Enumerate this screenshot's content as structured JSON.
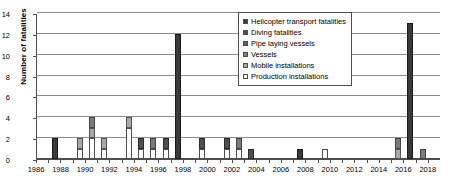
{
  "chart_data": {
    "type": "bar",
    "title": "",
    "xlabel": "",
    "ylabel": "Number of fatalities",
    "ylim": [
      0,
      14
    ],
    "ytick_step": 2,
    "yticks": [
      "0",
      "2",
      "4",
      "6",
      "8",
      "10",
      "12",
      "14"
    ],
    "xlim": [
      1986,
      2018
    ],
    "xticks": [
      "1986",
      "1988",
      "1990",
      "1992",
      "1994",
      "1996",
      "1998",
      "2000",
      "2002",
      "2004",
      "2006",
      "2008",
      "2010",
      "2012",
      "2014",
      "2016",
      "2018"
    ],
    "grid": "horizontal",
    "stacked": true,
    "legend_position": "top-right",
    "categories": [
      1986,
      1987,
      1988,
      1989,
      1990,
      1991,
      1992,
      1993,
      1994,
      1995,
      1996,
      1997,
      1998,
      1999,
      2000,
      2001,
      2002,
      2003,
      2004,
      2005,
      2006,
      2007,
      2008,
      2009,
      2010,
      2011,
      2012,
      2013,
      2014,
      2015,
      2016,
      2017,
      2018
    ],
    "series": [
      {
        "name": "Helicopter transport fatalities",
        "color": "#3a3a3a",
        "values": [
          0,
          2,
          0,
          0,
          0,
          0,
          0,
          0,
          0,
          0,
          0,
          12,
          0,
          0,
          0,
          0,
          0,
          0,
          0,
          0,
          0,
          1,
          0,
          0,
          0,
          0,
          0,
          0,
          0,
          0,
          13,
          0,
          0
        ]
      },
      {
        "name": "Diving fatalities",
        "color": "#4f4f4f",
        "values": [
          0,
          0,
          0,
          0,
          0,
          0,
          0,
          0,
          1,
          0,
          1,
          0,
          0,
          1,
          0,
          1,
          0,
          1,
          0,
          0,
          0,
          0,
          0,
          0,
          0,
          0,
          0,
          0,
          0,
          0,
          0,
          0,
          0
        ]
      },
      {
        "name": "Pipe laying vessels",
        "color": "#5f5f5f",
        "values": [
          0,
          0,
          0,
          0,
          0,
          0,
          0,
          0,
          0,
          0,
          0,
          0,
          0,
          0,
          0,
          0,
          0,
          0,
          0,
          0,
          0,
          0,
          0,
          0,
          0,
          0,
          0,
          0,
          0,
          0,
          0,
          0,
          0
        ]
      },
      {
        "name": "Vessels",
        "color": "#7a7a7a",
        "values": [
          0,
          0,
          0,
          0,
          1,
          0,
          0,
          0,
          0,
          1,
          0,
          0,
          0,
          0,
          0,
          0,
          1,
          0,
          0,
          0,
          0,
          0,
          0,
          0,
          0,
          0,
          0,
          0,
          0,
          1,
          0,
          1,
          0
        ]
      },
      {
        "name": "Mobile installations",
        "color": "#a8a8a8",
        "values": [
          0,
          0,
          0,
          1,
          1,
          1,
          0,
          1,
          0,
          0,
          0,
          0,
          0,
          0,
          0,
          0,
          0,
          0,
          0,
          0,
          0,
          0,
          0,
          0,
          0,
          0,
          0,
          0,
          0,
          1,
          0,
          0,
          0
        ]
      },
      {
        "name": "Production installations",
        "color": "#ffffff",
        "values": [
          0,
          0,
          0,
          1,
          2,
          1,
          0,
          3,
          1,
          1,
          1,
          0,
          0,
          1,
          0,
          1,
          1,
          0,
          0,
          0,
          0,
          0,
          0,
          1,
          0,
          0,
          0,
          0,
          0,
          0,
          0,
          0,
          0
        ]
      }
    ],
    "totals": [
      0,
      2,
      0,
      2,
      4,
      2,
      0,
      4,
      2,
      2,
      2,
      12,
      0,
      2,
      0,
      2,
      2,
      1,
      0,
      0,
      0,
      1,
      0,
      1,
      0,
      0,
      0,
      0,
      0,
      2,
      13,
      1,
      0
    ]
  },
  "legend": {
    "items": [
      {
        "label": "Helicopter transport fatalities"
      },
      {
        "label": "Diving fatalities"
      },
      {
        "label": "Pipe laying vessels"
      },
      {
        "label": "Vessels"
      },
      {
        "label": "Mobile installations"
      },
      {
        "label": "Production installations"
      }
    ]
  }
}
